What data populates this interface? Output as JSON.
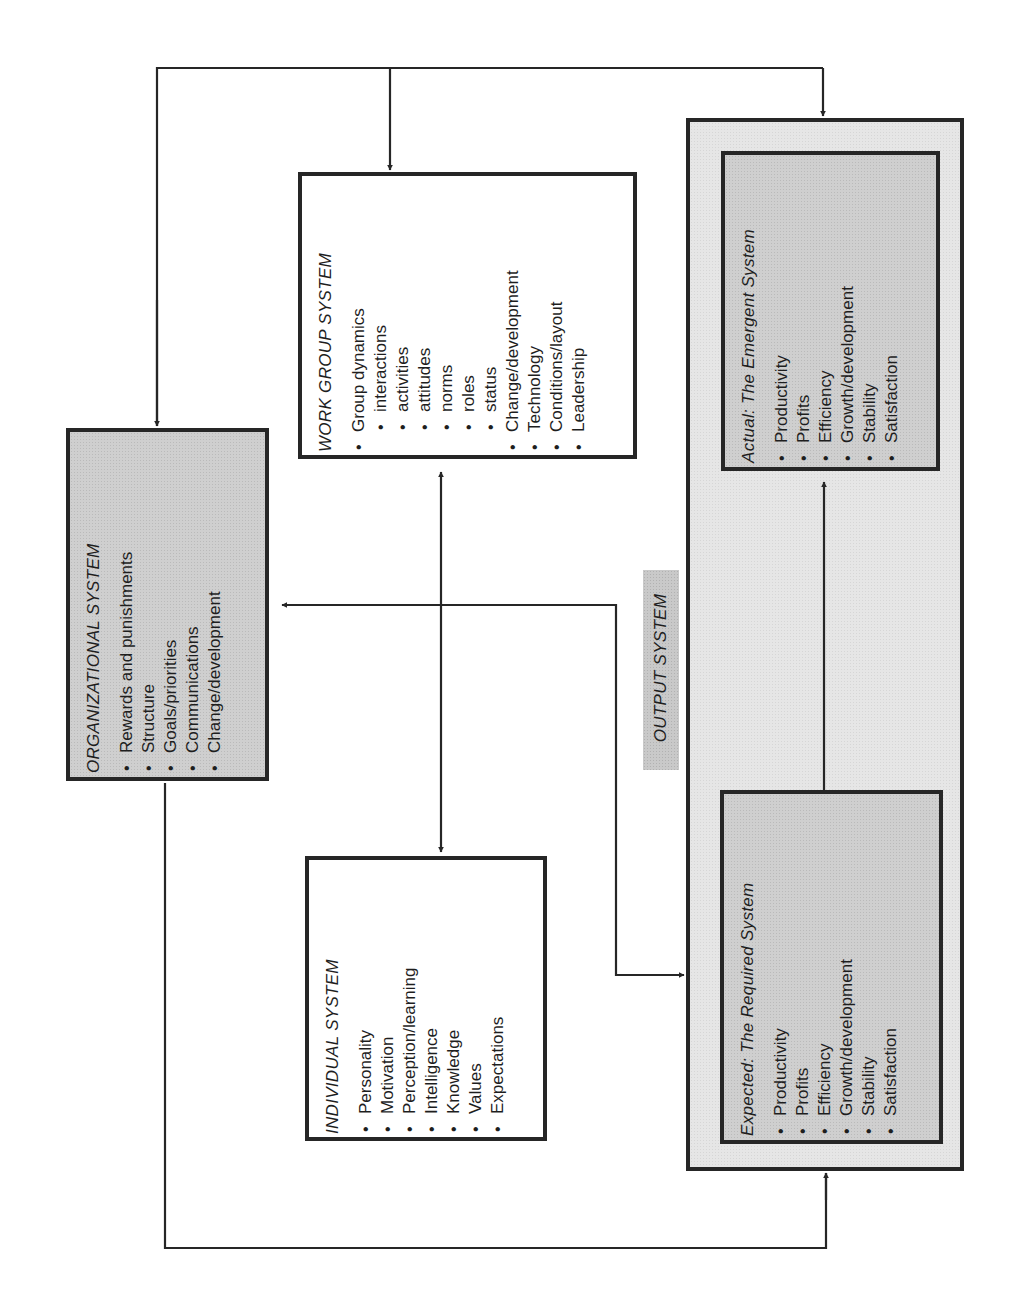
{
  "diagram": {
    "orientation": "rotated 90° counter-clockwise",
    "organizational_system": {
      "title": "ORGANIZATIONAL SYSTEM",
      "items": [
        "Rewards and punishments",
        "Structure",
        "Goals/priorities",
        "Communications",
        "Change/development"
      ]
    },
    "work_group_system": {
      "title": "WORK GROUP SYSTEM",
      "items": [
        {
          "label": "Group dynamics",
          "level": 0
        },
        {
          "label": "interactions",
          "level": 1
        },
        {
          "label": "activities",
          "level": 1
        },
        {
          "label": "attitudes",
          "level": 1
        },
        {
          "label": "norms",
          "level": 1
        },
        {
          "label": "roles",
          "level": 1
        },
        {
          "label": "status",
          "level": 1
        },
        {
          "label": "Change/development",
          "level": 0
        },
        {
          "label": "Technology",
          "level": 0
        },
        {
          "label": "Conditions/layout",
          "level": 0
        },
        {
          "label": "Leadership",
          "level": 0
        }
      ]
    },
    "individual_system": {
      "title": "INDIVIDUAL SYSTEM",
      "items": [
        "Personality",
        "Motivation",
        "Perception/learning",
        "Intelligence",
        "Knowledge",
        "Values",
        "Expectations"
      ]
    },
    "output_system": {
      "label": "OUTPUT SYSTEM",
      "actual": {
        "title": "Actual:  The Emergent System",
        "items": [
          "Productivity",
          "Profits",
          "Efficiency",
          "Growth/development",
          "Stability",
          "Satisfaction"
        ]
      },
      "expected": {
        "title": "Expected:  The Required System",
        "items": [
          "Productivity",
          "Profits",
          "Efficiency",
          "Growth/development",
          "Stability",
          "Satisfaction"
        ]
      }
    },
    "colors": {
      "line": "#262626",
      "shaded_box": "#cfcfcf",
      "output_panel": "#e6e6e6",
      "background": "#ffffff"
    }
  }
}
